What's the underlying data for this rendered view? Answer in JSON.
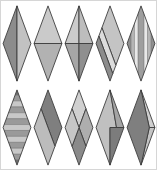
{
  "figure": {
    "background_color": "#ffffff",
    "frame_color": "#d6d6d6",
    "stroke_color": "#3c3c3c",
    "rows": [
      {
        "diamonds": [
          {
            "id": "r1-d1",
            "type": "split-vertical",
            "colors": [
              "#8c8c8c",
              "#c2c2c2"
            ]
          },
          {
            "id": "r1-d2",
            "type": "split-horizontal",
            "colors": [
              "#cacaca",
              "#b2b2b2"
            ]
          },
          {
            "id": "r1-d3",
            "type": "cross-quadrants",
            "colors": [
              "#cbcbcb",
              "#bdbdbd",
              "#a6a6a6",
              "#8f8f8f"
            ]
          },
          {
            "id": "r1-d4",
            "type": "diagonal-bands",
            "colors": [
              "#c4c4c4",
              "#dcdcdc",
              "#8c8c8c"
            ]
          },
          {
            "id": "r1-d5",
            "type": "vertical-stripes",
            "colors": [
              "#8f8f8f",
              "#b5b5b5",
              "#e8e8e8",
              "#9e9e9e",
              "#e8e8e8",
              "#b5b5b5",
              "#8f8f8f"
            ],
            "line_color": "#555555"
          }
        ]
      },
      {
        "diamonds": [
          {
            "id": "r2-d1",
            "type": "horizontal-stripes",
            "colors": [
              "#c8c8c8",
              "#9a9a9a"
            ],
            "tip_color": "#707070",
            "line_color": "#4a4a4a"
          },
          {
            "id": "r2-d2",
            "type": "split-diagonal",
            "colors": [
              "#7f7f7f",
              "#bcbcbc"
            ]
          },
          {
            "id": "r2-d3",
            "type": "four-rhombi",
            "colors": [
              "#d0d0d0",
              "#aeaeae",
              "#8a8a8a",
              "#c6c6c6"
            ]
          },
          {
            "id": "r2-d4",
            "type": "cube-corner",
            "colors": [
              "#c0c0c0",
              "#a4a4a4",
              "#7c7c7c"
            ]
          },
          {
            "id": "r2-d5",
            "type": "right-strip",
            "colors": [
              "#7f7f7f",
              "#cfcfcf",
              "#c4c4c4"
            ]
          }
        ]
      }
    ]
  }
}
